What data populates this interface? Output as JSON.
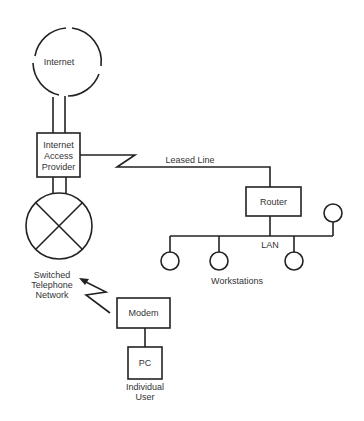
{
  "diagram": {
    "title": "",
    "nodes": {
      "internet": {
        "label": "Internet",
        "shape": "cloud-circle"
      },
      "iap": {
        "lines": [
          "Internet",
          "Access",
          "Provider"
        ],
        "shape": "box"
      },
      "switch": {
        "shape": "circle-x"
      },
      "switch_label": {
        "lines": [
          "Switched",
          "Telephone",
          "Network"
        ]
      },
      "router": {
        "label": "Router",
        "shape": "box"
      },
      "lan": {
        "label": "LAN"
      },
      "workstations": {
        "label": "Workstations",
        "count": 4
      },
      "modem": {
        "label": "Modem",
        "shape": "box"
      },
      "pc": {
        "label": "PC",
        "shape": "box"
      },
      "pc_caption": {
        "lines": [
          "Individual",
          "User"
        ]
      }
    },
    "edges": {
      "leased_line": {
        "label": "Leased Line",
        "from": "iap",
        "to": "router"
      },
      "internet_iap": {
        "from": "internet",
        "to": "iap"
      },
      "iap_switch": {
        "from": "iap",
        "to": "switch"
      },
      "modem_switch": {
        "from": "modem",
        "to": "switch",
        "style": "lightning-arrow"
      },
      "modem_pc": {
        "from": "modem",
        "to": "pc"
      },
      "router_lan": {
        "from": "router",
        "to": "lan"
      }
    },
    "colors": {
      "line": "#222222",
      "text": "#333333",
      "background": "#ffffff"
    }
  }
}
